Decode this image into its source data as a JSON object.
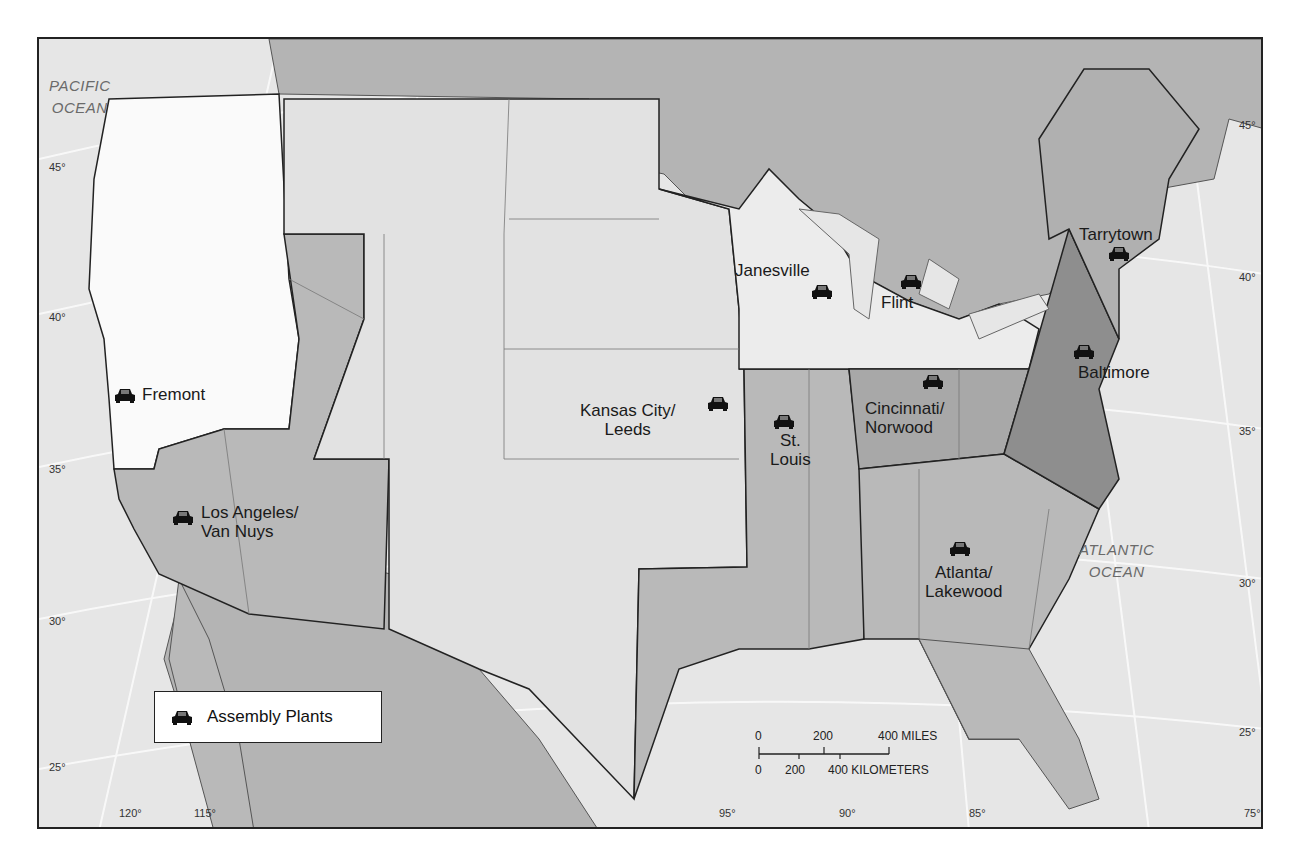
{
  "map": {
    "title": "Assembly Plants",
    "oceans": [
      {
        "name": "pacific",
        "line1": "PACIFIC",
        "line2": "OCEAN"
      },
      {
        "name": "atlantic",
        "line1": "ATLANTIC",
        "line2": "OCEAN"
      }
    ],
    "plants": [
      {
        "id": "fremont",
        "label": "Fremont"
      },
      {
        "id": "los-angeles",
        "label": "Los Angeles/",
        "label2": "Van Nuys"
      },
      {
        "id": "kansas-city",
        "label": "Kansas City/",
        "label2": "Leeds"
      },
      {
        "id": "st-louis",
        "label": "St.",
        "label2": "Louis"
      },
      {
        "id": "janesville",
        "label": "Janesville"
      },
      {
        "id": "flint",
        "label": "Flint"
      },
      {
        "id": "cincinnati",
        "label": "Cincinnati/",
        "label2": "Norwood"
      },
      {
        "id": "atlanta",
        "label": "Atlanta/",
        "label2": "Lakewood"
      },
      {
        "id": "baltimore",
        "label": "Baltimore"
      },
      {
        "id": "tarrytown",
        "label": "Tarrytown"
      }
    ],
    "legend": {
      "icon": "car-icon",
      "label": "Assembly Plants"
    },
    "scale": {
      "miles": [
        "0",
        "200",
        "400 MILES"
      ],
      "kilometers": [
        "0",
        "200",
        "400 KILOMETERS"
      ]
    },
    "latitudes_left": [
      "45°",
      "40°",
      "35°",
      "30°",
      "25°"
    ],
    "latitudes_right": [
      "45°",
      "40°",
      "35°",
      "30°",
      "25°"
    ],
    "longitudes": [
      "120°",
      "115°",
      "95°",
      "90°",
      "85°",
      "75°"
    ],
    "colors": {
      "ocean": "#e6e6e6",
      "foreign_land": "#b4b4b4",
      "region_white": "#fafafa",
      "region_light": "#e2e2e2",
      "region_medium": "#b9b9b9",
      "region_medium_dark": "#a8a8a8",
      "region_dark": "#8e8e8e",
      "border": "#222222"
    }
  }
}
